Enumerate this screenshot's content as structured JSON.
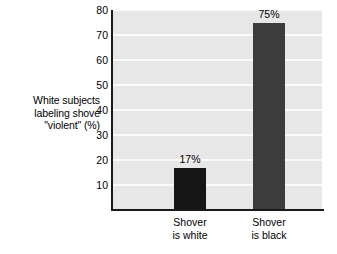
{
  "chart_data": {
    "type": "bar",
    "title": "",
    "xlabel": "",
    "ylabel": "White subjects labeling shove \"violent\" (%)",
    "ylabel_lines": [
      "White subjects",
      "labeling shove",
      "\"violent\" (%)"
    ],
    "categories": [
      "Shover is white",
      "Shover is black"
    ],
    "category_lines": [
      [
        "Shover",
        "is white"
      ],
      [
        "Shover",
        "is black"
      ]
    ],
    "values": [
      17,
      75
    ],
    "value_labels": [
      "17%",
      "75%"
    ],
    "bar_colors": [
      "#151515",
      "#3c3c3c"
    ],
    "ylim": [
      0,
      80
    ],
    "yticks": [
      10,
      20,
      30,
      40,
      50,
      60,
      70,
      80
    ],
    "ytick_labels": [
      "10",
      "20",
      "30",
      "40",
      "50",
      "60",
      "70",
      "80"
    ],
    "grid": true,
    "grid_color": "#fafafa",
    "plot_background": "#e7e7e7",
    "page_background": "#ffffff",
    "axis_color": "#1a1a1a",
    "legend": null,
    "legend_position": "none"
  }
}
